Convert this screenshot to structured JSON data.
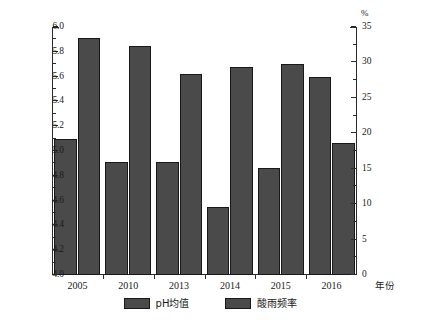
{
  "chart_data": {
    "type": "bar",
    "title": "",
    "subtitle": "",
    "categories": [
      "2005",
      "2010",
      "2013",
      "2014",
      "2015",
      "2016"
    ],
    "series": [
      {
        "name": "pH均值",
        "axis": "left",
        "values": [
          5.1,
          4.91,
          4.91,
          4.55,
          4.86,
          5.6
        ]
      },
      {
        "name": "酸雨频率",
        "axis": "right",
        "values": [
          33.5,
          32.3,
          28.4,
          29.4,
          29.8,
          18.7
        ]
      }
    ],
    "xlabel": "年份",
    "ylabel": "",
    "ylabel_right": "%",
    "ylim": [
      4.0,
      6.0
    ],
    "ylim_right": [
      0,
      35
    ],
    "ytick_labels": [
      "6.0",
      "5.8",
      "5.6",
      "5.4",
      "5.2",
      "5.0",
      "4.8",
      "4.6",
      "4.4",
      "4.2",
      "4.0"
    ],
    "ytick_values": [
      6.0,
      5.8,
      5.6,
      5.4,
      5.2,
      5.0,
      4.8,
      4.6,
      4.4,
      4.2,
      4.0
    ],
    "ytick_right_labels": [
      "35",
      "30",
      "25",
      "20",
      "15",
      "10",
      "5",
      "0"
    ],
    "ytick_right_values": [
      35,
      30,
      25,
      20,
      15,
      10,
      5,
      0
    ],
    "grid": false,
    "legend_position": "bottom",
    "legend": [
      "pH均值",
      "酸雨频率"
    ],
    "bar_color": "#4a4a4a",
    "bar_edge_color": "#181818",
    "axis_color": "#2b2b2b"
  },
  "axes": {
    "left_unit": "",
    "right_unit": "%",
    "x_title": "年份"
  },
  "legend": {
    "items": [
      {
        "label": "pH均值"
      },
      {
        "label": "酸雨频率"
      }
    ]
  },
  "caption": {
    "text": ""
  }
}
